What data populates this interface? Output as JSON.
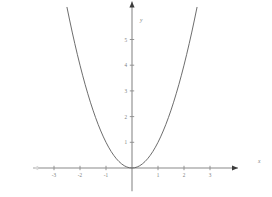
{
  "chart_data": {
    "type": "line",
    "title": "",
    "subtitle": "",
    "xlabel": "x",
    "ylabel": "y",
    "grid": false,
    "legend": false,
    "xlim": [
      -3.8,
      4.0
    ],
    "ylim": [
      -0.9,
      6.4
    ],
    "xticks": [
      -3,
      -2,
      -1,
      1,
      2,
      3
    ],
    "yticks": [
      1,
      2,
      3,
      4,
      5
    ],
    "xtick_labels": [
      "-3",
      "-2",
      "-1",
      "1",
      "2",
      "3"
    ],
    "ytick_labels": [
      "1",
      "2",
      "3",
      "4",
      "5"
    ],
    "series": [
      {
        "name": "y = x^2",
        "color": "#5c5c5c",
        "x": [
          -2.5,
          -2.4,
          -2.3,
          -2.2,
          -2.1,
          -2.0,
          -1.9,
          -1.8,
          -1.7,
          -1.6,
          -1.5,
          -1.4,
          -1.3,
          -1.2,
          -1.1,
          -1.0,
          -0.9,
          -0.8,
          -0.7,
          -0.6,
          -0.5,
          -0.4,
          -0.3,
          -0.2,
          -0.1,
          0.0,
          0.1,
          0.2,
          0.3,
          0.4,
          0.5,
          0.6,
          0.7,
          0.8,
          0.9,
          1.0,
          1.1,
          1.2,
          1.3,
          1.4,
          1.5,
          1.6,
          1.7,
          1.8,
          1.9,
          2.0,
          2.1,
          2.2,
          2.3,
          2.4,
          2.5
        ],
        "y": [
          6.25,
          5.76,
          5.29,
          4.84,
          4.41,
          4.0,
          3.61,
          3.24,
          2.89,
          2.56,
          2.25,
          1.96,
          1.69,
          1.44,
          1.21,
          1.0,
          0.81,
          0.64,
          0.49,
          0.36,
          0.25,
          0.16,
          0.09,
          0.04,
          0.01,
          0.0,
          0.01,
          0.04,
          0.09,
          0.16,
          0.25,
          0.36,
          0.49,
          0.64,
          0.81,
          1.0,
          1.21,
          1.44,
          1.69,
          1.96,
          2.25,
          2.56,
          2.89,
          3.24,
          3.61,
          4.0,
          4.41,
          4.84,
          5.29,
          5.76,
          6.25
        ]
      }
    ],
    "annotations": [],
    "axis_colors": {
      "axis": "#8a8a8a",
      "curve": "#5c5c5c",
      "label": "#7d7d7d",
      "arrow": "#3b3b3b",
      "background": "#ffffff"
    }
  }
}
